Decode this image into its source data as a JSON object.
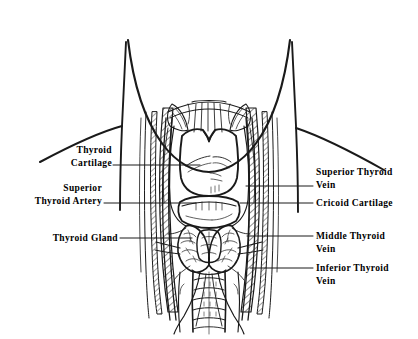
{
  "figure": {
    "background_color": "#ffffff",
    "ink_color": "#1a1a1a",
    "width": 418,
    "height": 339
  },
  "labels": {
    "thyroid_cartilage": {
      "line1": "Thyroid",
      "line2": "Cartilage",
      "side": "left"
    },
    "superior_thyroid_artery": {
      "line1": "Superior",
      "line2": "Thyroid Artery",
      "side": "left"
    },
    "thyroid_gland": {
      "line1": "Thyroid Gland",
      "line2": "",
      "side": "left"
    },
    "superior_thyroid_vein": {
      "line1": "Superior Thyroid",
      "line2": "Vein",
      "side": "right"
    },
    "cricoid_cartilage": {
      "line1": "Cricoid Cartilage",
      "line2": "",
      "side": "right"
    },
    "middle_thyroid_vein": {
      "line1": "Middle  Thyroid",
      "line2": "Vein",
      "side": "right"
    },
    "inferior_thyroid_vein": {
      "line1": "Inferior Thyroid",
      "line2": "Vein",
      "side": "right"
    }
  },
  "structures": [
    {
      "name": "chin-jaw-outline",
      "label": "Chin / jaw line"
    },
    {
      "name": "neck-left-outline",
      "label": "Left neck border"
    },
    {
      "name": "neck-right-outline",
      "label": "Right neck border"
    },
    {
      "name": "shoulder-left",
      "label": "Left shoulder slope"
    },
    {
      "name": "shoulder-right",
      "label": "Right shoulder slope"
    },
    {
      "name": "thyroid-cartilage",
      "label": "Thyroid cartilage (laryngeal prominence)"
    },
    {
      "name": "cricoid-cartilage",
      "label": "Cricoid cartilage"
    },
    {
      "name": "thyroid-gland-left-lobe",
      "label": "Left lobe of thyroid gland"
    },
    {
      "name": "thyroid-gland-right-lobe",
      "label": "Right lobe of thyroid gland"
    },
    {
      "name": "thyroid-isthmus",
      "label": "Thyroid isthmus"
    },
    {
      "name": "trachea",
      "label": "Trachea with cartilage rings"
    },
    {
      "name": "sternocleidomastoid-left",
      "label": "Left sternocleidomastoid (hatched)"
    },
    {
      "name": "sternocleidomastoid-right",
      "label": "Right sternocleidomastoid (hatched)"
    },
    {
      "name": "strap-muscles",
      "label": "Infrahyoid strap muscles"
    },
    {
      "name": "jugular-vein-left",
      "label": "Left internal jugular vein"
    },
    {
      "name": "jugular-vein-right",
      "label": "Right internal jugular vein"
    },
    {
      "name": "thyroid-vessels",
      "label": "Thyroid arteries and veins"
    }
  ]
}
